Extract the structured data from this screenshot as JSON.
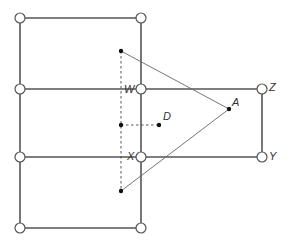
{
  "diagram": {
    "colors": {
      "line": "#555555",
      "node_fill": "#ffffff",
      "point": "#111111",
      "label": "#333333"
    },
    "grid_nodes": [
      {
        "x": 20,
        "y": 18
      },
      {
        "x": 141,
        "y": 18
      },
      {
        "x": 20,
        "y": 89
      },
      {
        "x": 141,
        "y": 89
      },
      {
        "x": 20,
        "y": 157
      },
      {
        "x": 141,
        "y": 157
      },
      {
        "x": 20,
        "y": 228
      },
      {
        "x": 141,
        "y": 228
      },
      {
        "x": 262,
        "y": 89
      },
      {
        "x": 262,
        "y": 157
      }
    ],
    "labels": {
      "W": "W",
      "X": "X",
      "D": "D",
      "A": "A",
      "Z": "Z",
      "Y": "Y"
    },
    "points": {
      "top": {
        "x": 121,
        "y": 51
      },
      "middle": {
        "x": 121,
        "y": 125
      },
      "bottom": {
        "x": 121,
        "y": 191
      },
      "D": {
        "x": 159,
        "y": 125
      },
      "A": {
        "x": 229,
        "y": 109
      }
    }
  }
}
